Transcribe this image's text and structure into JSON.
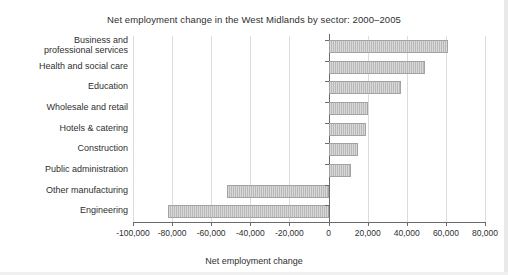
{
  "chart_data": {
    "type": "bar",
    "orientation": "horizontal",
    "title": "Net employment change in the West Midlands by sector: 2000–2005",
    "xlabel": "Net employment change",
    "ylabel": "",
    "categories": [
      "Business and\nprofessional services",
      "Health and social care",
      "Education",
      "Wholesale and retail",
      "Hotels & catering",
      "Construction",
      "Public administration",
      "Other manufacturing",
      "Engineering"
    ],
    "values": [
      61000,
      49500,
      37000,
      20000,
      19000,
      15000,
      11500,
      -52000,
      -82000
    ],
    "xlim": [
      -100000,
      80000
    ],
    "xticks": [
      -100000,
      -80000,
      -60000,
      -40000,
      -20000,
      0,
      20000,
      40000,
      60000,
      80000
    ],
    "xtick_labels": [
      "-100,000",
      "-80,000",
      "-60,000",
      "-40,000",
      "-20,000",
      "0",
      "20,000",
      "40,000",
      "60,000",
      "80,000"
    ],
    "grid": "vertical",
    "legend": null,
    "bar_color": "#b9b9b9",
    "bar_border_color": "#a3a3a3",
    "gridline_color": "#dcdcdc",
    "axis_color": "#6b6b6b"
  },
  "categories_display": [
    [
      "Business and",
      "professional services"
    ],
    [
      "Health and social care"
    ],
    [
      "Education"
    ],
    [
      "Wholesale and retail"
    ],
    [
      "Hotels & catering"
    ],
    [
      "Construction"
    ],
    [
      "Public administration"
    ],
    [
      "Other manufacturing"
    ],
    [
      "Engineering"
    ]
  ]
}
